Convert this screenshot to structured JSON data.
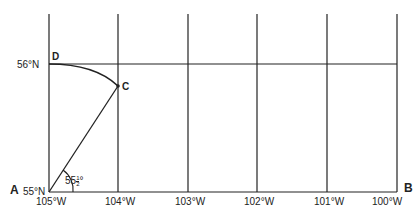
{
  "diagram": {
    "longitudes": [
      "105°W",
      "104°W",
      "103°W",
      "102°W",
      "101°W",
      "100°W"
    ],
    "latitudes": [
      "55°N",
      "56°N"
    ],
    "points": {
      "A": "A",
      "B": "B",
      "C": "C",
      "D": "D"
    },
    "angle_label": "55½°",
    "angle_main": "55",
    "angle_frac_num": "1",
    "angle_frac_den": "2",
    "degree": "°",
    "line_color": "#222222",
    "background": "#ffffff"
  }
}
